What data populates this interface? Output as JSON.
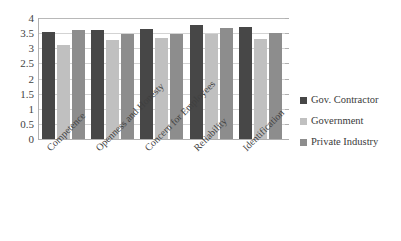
{
  "chart_data": {
    "type": "bar",
    "title": "",
    "xlabel": "",
    "ylabel": "",
    "ylim": [
      0,
      4
    ],
    "yticks": [
      "0",
      "0.5",
      "1",
      "1.5",
      "2",
      "2.5",
      "3",
      "3.5",
      "4"
    ],
    "ytick_values": [
      0,
      0.5,
      1,
      1.5,
      2,
      2.5,
      3,
      3.5,
      4
    ],
    "grid": true,
    "legend_position": "right",
    "categories": [
      "Competence",
      "Openness and Honesty",
      "Concern for Employees",
      "Reliability",
      "Identification"
    ],
    "series": [
      {
        "name": "Gov. Contractor",
        "color": "#474747",
        "values": [
          3.53,
          3.61,
          3.63,
          3.78,
          3.69
        ]
      },
      {
        "name": "Government",
        "color": "#c0c0c0",
        "values": [
          3.1,
          3.26,
          3.35,
          3.48,
          3.3
        ]
      },
      {
        "name": "Private Industry",
        "color": "#8d8d8d",
        "values": [
          3.6,
          3.48,
          3.46,
          3.66,
          3.51
        ]
      }
    ]
  },
  "legend": {
    "items": [
      {
        "label": "Gov. Contractor",
        "color": "#474747"
      },
      {
        "label": "Government",
        "color": "#c0c0c0"
      },
      {
        "label": "Private Industry",
        "color": "#8d8d8d"
      }
    ]
  },
  "axis": {
    "y_tick_labels": [
      "4",
      "3.5",
      "3",
      "2.5",
      "2",
      "1.5",
      "1",
      "0.5",
      "0"
    ]
  }
}
